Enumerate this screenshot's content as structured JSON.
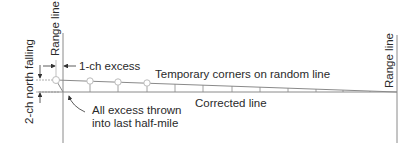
{
  "diagram": {
    "labels": {
      "range_line_left": "Range line",
      "range_line_right": "Range line",
      "excess": "1-ch excess",
      "north_falling": "2-ch north falling",
      "temporary_corners": "Temporary corners on random line",
      "corrected_line": "Corrected line",
      "all_excess_line1": "All excess thrown",
      "all_excess_line2": "into last half-mile"
    },
    "colors": {
      "line": "#8a8a8a",
      "text": "#2a2a2a",
      "circle_fill": "#ffffff"
    }
  }
}
